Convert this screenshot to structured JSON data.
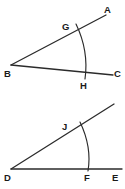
{
  "figure": {
    "background_color": "#ffffff",
    "stroke_color": "#2b2b2b",
    "label_color": "#1a1a1a",
    "width": 125,
    "height": 189,
    "diagrams": [
      {
        "id": "upper-angle",
        "name": "angle-ABC",
        "vertex_label": "B",
        "vertex": {
          "x": 11,
          "y": 65
        },
        "rays": [
          {
            "name": "ray-BA",
            "from_label": "B",
            "to_label": "A",
            "x1": 11,
            "y1": 65,
            "x2": 106,
            "y2": 15
          },
          {
            "name": "ray-BC",
            "from_label": "B",
            "to_label": "C",
            "x1": 11,
            "y1": 65,
            "x2": 113,
            "y2": 75
          }
        ],
        "arc": {
          "name": "arc-GH",
          "start": {
            "x": 76,
            "y": 24
          },
          "end": {
            "x": 85,
            "y": 79
          },
          "control": {
            "x": 89,
            "y": 51
          }
        },
        "labels": [
          {
            "text": "A",
            "x": 104,
            "y": 13,
            "name": "label-A"
          },
          {
            "text": "B",
            "x": 4,
            "y": 77,
            "name": "label-B"
          },
          {
            "text": "C",
            "x": 114,
            "y": 77,
            "name": "label-C"
          },
          {
            "text": "G",
            "x": 62,
            "y": 30,
            "name": "label-G"
          },
          {
            "text": "H",
            "x": 80,
            "y": 89,
            "name": "label-H"
          }
        ]
      },
      {
        "id": "lower-angle",
        "name": "angle-DE",
        "vertex_label": "D",
        "vertex": {
          "x": 11,
          "y": 169
        },
        "rays": [
          {
            "name": "ray-D-upper",
            "from_label": "D",
            "to_label": "",
            "x1": 11,
            "y1": 169,
            "x2": 114,
            "y2": 104
          },
          {
            "name": "ray-DE",
            "from_label": "D",
            "to_label": "E",
            "x1": 11,
            "y1": 169,
            "x2": 122,
            "y2": 169
          }
        ],
        "arc": {
          "name": "arc-JF",
          "start": {
            "x": 80,
            "y": 122
          },
          "end": {
            "x": 88,
            "y": 171
          },
          "control": {
            "x": 92,
            "y": 147
          }
        },
        "labels": [
          {
            "text": "D",
            "x": 4,
            "y": 181,
            "name": "label-D"
          },
          {
            "text": "E",
            "x": 112,
            "y": 181,
            "name": "label-E"
          },
          {
            "text": "F",
            "x": 84,
            "y": 181,
            "name": "label-F"
          },
          {
            "text": "J",
            "x": 62,
            "y": 130,
            "name": "label-J"
          }
        ]
      }
    ]
  }
}
